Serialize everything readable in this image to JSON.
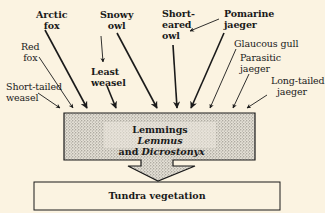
{
  "predators": [
    {
      "id": "short-tailed-weasel",
      "line1": "Short-tailed",
      "line2": "weasel",
      "bold": false
    },
    {
      "id": "red-fox",
      "line1": "Red",
      "line2": "fox",
      "bold": false
    },
    {
      "id": "arctic-fox",
      "line1": "Arctic",
      "line2": "fox",
      "bold": true
    },
    {
      "id": "least-weasel",
      "line1": "Least",
      "line2": "weasel",
      "bold": true
    },
    {
      "id": "snowy-owl",
      "line1": "Snowy",
      "line2": "owl",
      "bold": true
    },
    {
      "id": "short-eared-owl",
      "line1": "Short-",
      "line2": "eared",
      "line3": "owl",
      "bold": true
    },
    {
      "id": "pomarine-jaeger",
      "line1": "Pomarine",
      "line2": "jaeger",
      "bold": true
    },
    {
      "id": "glaucous-gull",
      "line1": "Glaucous gull",
      "bold": false
    },
    {
      "id": "parasitic-jaeger",
      "line1": "Parasitic",
      "line2": "jaeger",
      "bold": false
    },
    {
      "id": "long-tailed-jaeger",
      "line1": "Long-tailed",
      "line2": "jaeger",
      "bold": false
    }
  ],
  "prey_box": {
    "title": "Lemmings",
    "genera_line": "Lemmus and Dicrostonyx",
    "genus1": "Lemmus",
    "conj": " and ",
    "genus2": "Dicrostonyx"
  },
  "base_box": {
    "label": "Tundra vegetation"
  },
  "colors": {
    "background": "#fbf3e1",
    "ink": "#1a1a1a",
    "stipple": "#c9c4b8"
  }
}
